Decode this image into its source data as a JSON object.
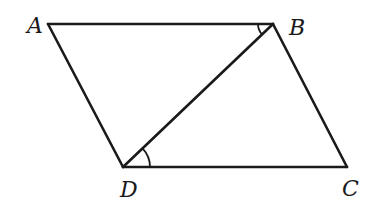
{
  "diagram": {
    "type": "parallelogram-with-diagonal",
    "vertices": {
      "A": {
        "label": "A",
        "x": 48,
        "y": 24
      },
      "B": {
        "label": "B",
        "x": 273,
        "y": 24
      },
      "C": {
        "label": "C",
        "x": 347,
        "y": 167
      },
      "D": {
        "label": "D",
        "x": 123,
        "y": 167
      }
    },
    "segments": [
      "AB",
      "BC",
      "CD",
      "DA",
      "BD"
    ],
    "angle_marks": [
      {
        "vertex": "B",
        "between": [
          "BA",
          "BD"
        ],
        "arcs": 1
      },
      {
        "vertex": "D",
        "between": [
          "DB",
          "DC"
        ],
        "arcs": 1
      }
    ],
    "labels": {
      "A": "A",
      "B": "B",
      "C": "C",
      "D": "D"
    },
    "colors": {
      "stroke": "#1a1a1a",
      "background": "#ffffff"
    }
  }
}
